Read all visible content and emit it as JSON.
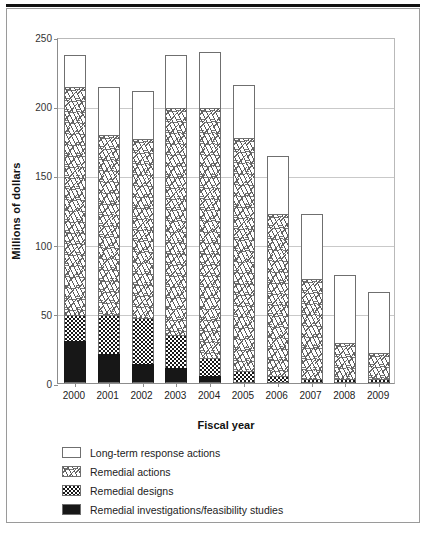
{
  "chart_data": {
    "type": "bar",
    "subtype": "stacked-vertical",
    "title": "",
    "xlabel": "Fiscal year",
    "ylabel": "Millions of dollars",
    "categories": [
      "2000",
      "2001",
      "2002",
      "2003",
      "2004",
      "2005",
      "2006",
      "2007",
      "2008",
      "2009"
    ],
    "ylim": [
      0,
      250
    ],
    "yticks": [
      0,
      50,
      100,
      150,
      200,
      250
    ],
    "ytick_labels": [
      "0",
      "50",
      "100",
      "150",
      "200",
      "250"
    ],
    "grid": "horizontal",
    "legend_position": "below-plot",
    "series": [
      {
        "name": "Remedial investigations/feasibility studies",
        "pattern": "solid-black",
        "values": [
          30,
          21,
          14,
          11,
          5,
          1,
          1,
          1,
          1,
          1
        ]
      },
      {
        "name": "Remedial designs",
        "pattern": "checkerboard",
        "values": [
          19,
          28,
          33,
          24,
          13,
          8,
          4,
          2,
          2,
          2
        ]
      },
      {
        "name": "Remedial actions",
        "pattern": "diagonal-hatch",
        "values": [
          165,
          130,
          129,
          164,
          181,
          168,
          117,
          72,
          26,
          19
        ]
      },
      {
        "name": "Long-term response actions",
        "pattern": "open-white",
        "values": [
          23,
          35,
          35,
          38,
          40,
          38,
          42,
          47,
          49,
          44
        ]
      }
    ],
    "totals": [
      237,
      214,
      211,
      237,
      239,
      215,
      164,
      122,
      78,
      66
    ]
  },
  "legend": {
    "items": [
      {
        "label": "Long-term response actions",
        "pattern": "open-white"
      },
      {
        "label": "Remedial actions",
        "pattern": "diagonal-hatch"
      },
      {
        "label": "Remedial designs",
        "pattern": "checkerboard"
      },
      {
        "label": "Remedial investigations/feasibility studies",
        "pattern": "solid-black"
      }
    ]
  }
}
